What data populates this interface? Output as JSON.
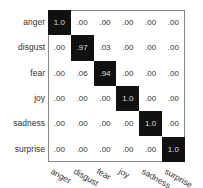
{
  "chart_data": {
    "type": "heatmap",
    "title": "",
    "xlabel": "",
    "ylabel": "",
    "rows": [
      "anger",
      "disgust",
      "fear",
      "joy",
      "sadness",
      "surprise"
    ],
    "cols": [
      "anger",
      "disgust",
      "fear",
      "joy",
      "sadness",
      "surprise"
    ],
    "values": [
      [
        1.0,
        0.0,
        0.0,
        0.0,
        0.0,
        0.0
      ],
      [
        0.0,
        0.97,
        0.03,
        0.0,
        0.0,
        0.0
      ],
      [
        0.0,
        0.06,
        0.94,
        0.0,
        0.0,
        0.0
      ],
      [
        0.0,
        0.0,
        0.0,
        1.0,
        0.0,
        0.0
      ],
      [
        0.0,
        0.0,
        0.0,
        0.0,
        1.0,
        0.0
      ],
      [
        0.0,
        0.0,
        0.0,
        0.0,
        0.0,
        1.0
      ]
    ],
    "labels": [
      [
        "1.0",
        ".00",
        ".00",
        ".00",
        ".00",
        ".00"
      ],
      [
        ".00",
        ".97",
        ".03",
        ".00",
        ".00",
        ".00"
      ],
      [
        ".00",
        ".06",
        ".94",
        ".00",
        ".00",
        ".00"
      ],
      [
        ".00",
        ".00",
        ".00",
        "1.0",
        ".00",
        ".00"
      ],
      [
        ".00",
        ".00",
        ".00",
        ".00",
        "1.0",
        ".00"
      ],
      [
        ".00",
        ".00",
        ".00",
        ".00",
        ".00",
        "1.0"
      ]
    ],
    "colormap": {
      "high": "#111111",
      "low": "#ffffff"
    }
  }
}
